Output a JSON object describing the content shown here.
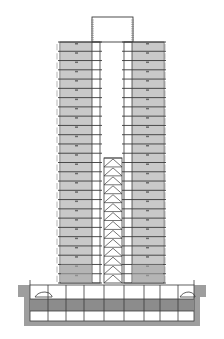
{
  "drawing": {
    "title": "High-rise building section",
    "view": "elevation-section",
    "floors_above_ground": 26,
    "basement_levels": 2,
    "colors": {
      "background": "#ffffff",
      "floor_fill": "#c9c9c9",
      "line": "#3a3a3a",
      "ground_fill": "#9e9e9e",
      "basement_fill": "#8c8c8c",
      "light_line": "#6a6a6a"
    },
    "elements": {
      "rooftop_cap": "Rooftop mechanical frame",
      "left_tower": "Left tower wing",
      "right_tower": "Right tower wing",
      "core_bracing": "Braced central core",
      "podium": "Podium levels",
      "basement": "Basement parking",
      "ground": "Ground"
    }
  }
}
